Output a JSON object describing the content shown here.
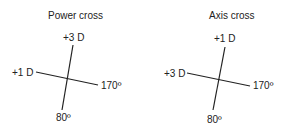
{
  "power_cross": {
    "title": "Power cross",
    "top_label": "+3 D",
    "left_label": "+1 D",
    "right_label": "170º",
    "bottom_label": "80º"
  },
  "axis_cross": {
    "title": "Axis cross",
    "top_label": "+1 D",
    "left_label": "+3 D",
    "right_label": "170º",
    "bottom_label": "80º"
  },
  "colors": {
    "line": "#222222",
    "text": "#222222",
    "background": "#ffffff"
  }
}
